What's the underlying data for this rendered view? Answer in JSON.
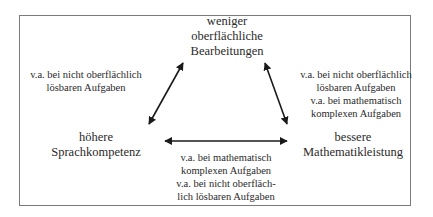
{
  "diagram": {
    "nodes": {
      "top": {
        "lines": [
          "weniger",
          "oberflächliche",
          "Bearbeitungen"
        ]
      },
      "left": {
        "lines": [
          "höhere",
          "Sprachkompetenz"
        ]
      },
      "right": {
        "lines": [
          "bessere",
          "Mathematikleistung"
        ]
      }
    },
    "edge_labels": {
      "left_edge": {
        "lines": [
          "v.a. bei nicht oberflächlich",
          "lösbaren Aufgaben"
        ]
      },
      "right_edge": {
        "lines": [
          "v.a. bei nicht oberflächlich",
          "lösbaren Aufgaben",
          "v.a. bei mathematisch",
          "komplexen Aufgaben"
        ]
      },
      "bottom_edge": {
        "lines": [
          "v.a. bei mathematisch",
          "komplexen Aufgaben",
          "v.a. bei nicht oberfläch-",
          "lich lösbaren Aufgaben"
        ]
      }
    },
    "edges": [
      {
        "from": "left",
        "to": "top",
        "type": "bidirectional"
      },
      {
        "from": "top",
        "to": "right",
        "type": "bidirectional"
      },
      {
        "from": "left",
        "to": "right",
        "type": "bidirectional"
      }
    ]
  }
}
